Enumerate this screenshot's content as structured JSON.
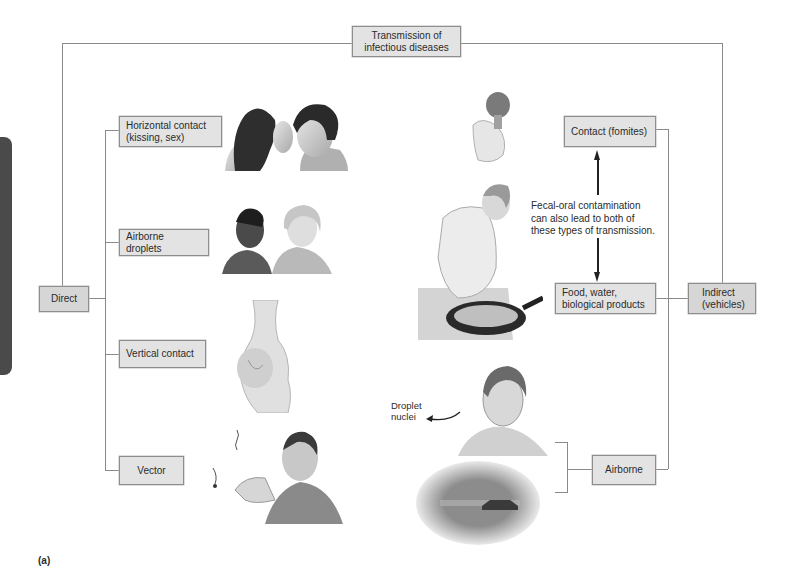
{
  "title": "Transmission of infectious diseases",
  "title_lines": [
    "Transmission of",
    "infectious diseases"
  ],
  "direct": {
    "label": "Direct",
    "branches": [
      {
        "label_lines": [
          "Horizontal contact",
          "(kissing, sex)"
        ],
        "illustration": "couple-kissing"
      },
      {
        "label_lines": [
          "Airborne droplets"
        ],
        "illustration": "two-people-talking"
      },
      {
        "label_lines": [
          "Vertical contact"
        ],
        "illustration": "pregnant-woman"
      },
      {
        "label_lines": [
          "Vector"
        ],
        "illustration": "man-swatting-insects"
      }
    ]
  },
  "indirect": {
    "label_lines": [
      "Indirect",
      "(vehicles)"
    ],
    "branches": [
      {
        "label_lines": [
          "Contact (fomites)"
        ],
        "illustration": "hand-holding-object"
      },
      {
        "label_lines": [
          "Food, water,",
          "biological products"
        ],
        "illustration": "woman-cooking-in-pan"
      },
      {
        "label_lines": [
          "Airborne"
        ],
        "illustrations": [
          "man-coughing",
          "car-dust-cloud"
        ]
      }
    ],
    "fecal_oral_note_lines": [
      "Fecal-oral contamination",
      "can also lead to both of",
      "these types of transmission."
    ],
    "droplet_label_lines": [
      "Droplet",
      "nuclei"
    ]
  },
  "caption": "(a)",
  "colors": {
    "box_fill": "#e3e3e3",
    "box_border": "#8e8e8e",
    "connector": "#8a8a8a",
    "side_tab": "#4a4a4a"
  }
}
